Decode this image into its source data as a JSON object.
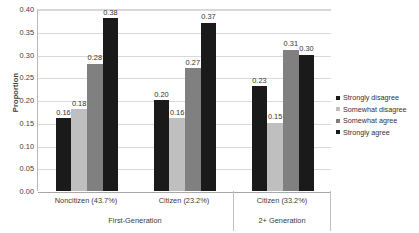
{
  "chart_data": {
    "type": "bar",
    "title": "",
    "xlabel": "",
    "ylabel": "Proportion",
    "ylim": [
      0.0,
      0.4
    ],
    "ytick_step": 0.05,
    "grid": true,
    "legend_position": "right",
    "categories": [
      "Noncitizen (43.7%)",
      "Citizen (23.2%)",
      "Citizen (33.2%)"
    ],
    "category_groups": [
      {
        "label": "First-Generation",
        "categories": [
          "Noncitizen (43.7%)",
          "Citizen (23.2%)"
        ]
      },
      {
        "label": "2+ Generation",
        "categories": [
          "Citizen (33.2%)"
        ]
      }
    ],
    "series": [
      {
        "name": "Strongly disagree",
        "color": "#1a1a1a",
        "values": [
          0.16,
          0.2,
          0.23
        ]
      },
      {
        "name": "Somewhat disagree",
        "color": "#bfbfbf",
        "values": [
          0.18,
          0.16,
          0.15
        ]
      },
      {
        "name": "Somewhat agree",
        "color": "#808080",
        "values": [
          0.28,
          0.27,
          0.31
        ]
      },
      {
        "name": "Strongly agree",
        "color": "#1a1a1a",
        "values": [
          0.38,
          0.37,
          0.3
        ]
      }
    ],
    "ytick_labels": [
      "0.40",
      "0.35",
      "0.30",
      "0.25",
      "0.20",
      "0.15",
      "0.10",
      "0.05",
      "0.00"
    ],
    "value_labels": [
      [
        "0.16",
        "0.18",
        "0.28",
        "0.38"
      ],
      [
        "0.20",
        "0.16",
        "0.27",
        "0.37"
      ],
      [
        "0.23",
        "0.15",
        "0.31",
        "0.30"
      ]
    ]
  },
  "axis": {
    "y_title": "Proportion"
  },
  "legend": {
    "items": [
      {
        "label": "Strongly disagree"
      },
      {
        "label": "Somewhat disagree"
      },
      {
        "label": "Somewhat agree"
      },
      {
        "label": "Strongly agree"
      }
    ]
  }
}
